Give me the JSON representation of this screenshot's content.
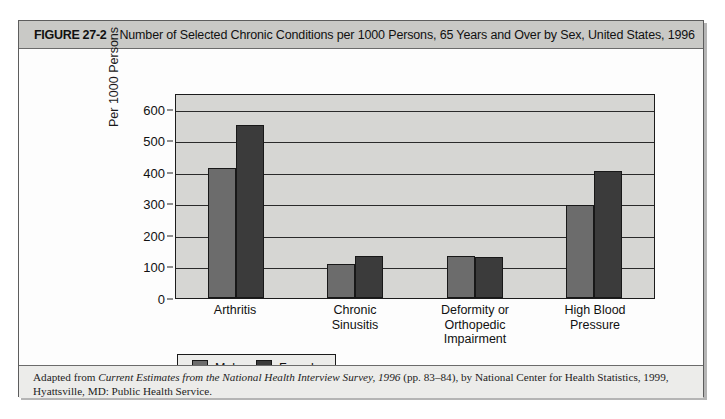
{
  "figure": {
    "number": "FIGURE 27-2",
    "title": "Number of Selected Chronic Conditions per 1000 Persons, 65 Years and Over by Sex, United States, 1996"
  },
  "source_note": {
    "line1_pre": "Adapted from ",
    "line1_italic": "Current Estimates from the National Health Interview Survey, 1996",
    "line1_post": " (pp. 83–84), by National Center for Health Statistics, 1999,",
    "line2": "Hyattsville, MD: Public Health Service."
  },
  "legend": {
    "items": [
      {
        "label": "Male",
        "color": "#6c6c6c"
      },
      {
        "label": "Female",
        "color": "#3b3b3b"
      }
    ]
  },
  "axis": {
    "y_title": "Per 1000 Persons",
    "y_ticks": [
      "0",
      "100",
      "200",
      "300",
      "400",
      "500",
      "600"
    ]
  },
  "categories_display": [
    "Arthritis",
    "Chronic\nSinusitis",
    "Deformity or\nOrthopedic\nImpairment",
    "High Blood\nPressure"
  ],
  "chart_data": {
    "type": "bar",
    "title": "Number of Selected Chronic Conditions per 1000 Persons, 65 Years and Over by Sex, United States, 1996",
    "xlabel": "",
    "ylabel": "Per 1000 Persons",
    "ylim": [
      0,
      650
    ],
    "yticks": [
      0,
      100,
      200,
      300,
      400,
      500,
      600
    ],
    "grid": true,
    "legend_position": "below-plot-left",
    "categories": [
      "Arthritis",
      "Chronic Sinusitis",
      "Deformity or Orthopedic Impairment",
      "High Blood Pressure"
    ],
    "series": [
      {
        "name": "Male",
        "color": "#6c6c6c",
        "values": [
          413,
          107,
          133,
          296
        ]
      },
      {
        "name": "Female",
        "color": "#3b3b3b",
        "values": [
          548,
          133,
          131,
          402
        ]
      }
    ]
  }
}
